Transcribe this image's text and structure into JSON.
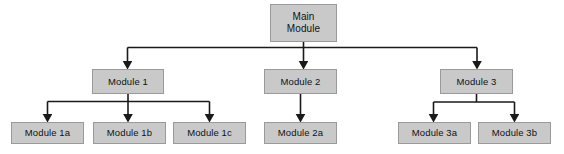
{
  "diagram": {
    "type": "tree-hierarchy",
    "canvas": {
      "width": 564,
      "height": 154
    },
    "style": {
      "node_fill": "#c9c9c9",
      "node_border": "#9a9a9a",
      "connector_color": "#1a1a1a",
      "background": "#ffffff",
      "text_color": "#111111"
    },
    "nodes": [
      {
        "id": "main",
        "label": "Main\nModule",
        "level": 0,
        "x": 270,
        "y": 4,
        "w": 67,
        "h": 38
      },
      {
        "id": "module1",
        "label": "Module 1",
        "level": 1,
        "x": 92,
        "y": 69,
        "w": 72,
        "h": 25
      },
      {
        "id": "module2",
        "label": "Module 2",
        "level": 1,
        "x": 264,
        "y": 69,
        "w": 73,
        "h": 25
      },
      {
        "id": "module3",
        "label": "Module 3",
        "level": 1,
        "x": 440,
        "y": 69,
        "w": 73,
        "h": 25
      },
      {
        "id": "module1a",
        "label": "Module 1a",
        "level": 2,
        "x": 11,
        "y": 122,
        "w": 73,
        "h": 22
      },
      {
        "id": "module1b",
        "label": "Module 1b",
        "level": 2,
        "x": 93,
        "y": 122,
        "w": 73,
        "h": 22
      },
      {
        "id": "module1c",
        "label": "Module 1c",
        "level": 2,
        "x": 173,
        "y": 122,
        "w": 73,
        "h": 22
      },
      {
        "id": "module2a",
        "label": "Module 2a",
        "level": 2,
        "x": 264,
        "y": 122,
        "w": 73,
        "h": 22
      },
      {
        "id": "module3a",
        "label": "Module 3a",
        "level": 2,
        "x": 398,
        "y": 122,
        "w": 73,
        "h": 22
      },
      {
        "id": "module3b",
        "label": "Module 3b",
        "level": 2,
        "x": 478,
        "y": 122,
        "w": 73,
        "h": 22
      }
    ],
    "edges": [
      {
        "from": "main",
        "to": "module1",
        "kind": "elbow"
      },
      {
        "from": "main",
        "to": "module2",
        "kind": "straight"
      },
      {
        "from": "main",
        "to": "module3",
        "kind": "elbow"
      },
      {
        "from": "module1",
        "to": "module1a",
        "kind": "elbow"
      },
      {
        "from": "module1",
        "to": "module1b",
        "kind": "straight"
      },
      {
        "from": "module1",
        "to": "module1c",
        "kind": "elbow"
      },
      {
        "from": "module2",
        "to": "module2a",
        "kind": "straight"
      },
      {
        "from": "module3",
        "to": "module3a",
        "kind": "elbow"
      },
      {
        "from": "module3",
        "to": "module3b",
        "kind": "elbow"
      }
    ]
  }
}
